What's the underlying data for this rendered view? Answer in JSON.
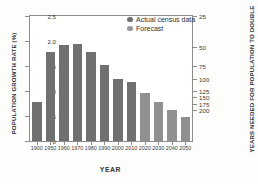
{
  "chart_data": {
    "type": "bar",
    "title": "",
    "xlabel": "YEAR",
    "ylabel": "POPULATION GROWTH RATE (%)",
    "ylabel_right": "YEARS NEEDED FOR POPULATION TO DOUBLE",
    "categories": [
      "1900",
      "1950",
      "1960",
      "1970",
      "1980",
      "1990",
      "2000",
      "2010",
      "2020",
      "2030",
      "2040",
      "2050"
    ],
    "values": [
      0.78,
      1.78,
      1.93,
      1.94,
      1.78,
      1.52,
      1.25,
      1.18,
      0.97,
      0.78,
      0.63,
      0.49
    ],
    "series_of_point": [
      "actual",
      "actual",
      "actual",
      "actual",
      "actual",
      "actual",
      "actual",
      "actual",
      "forecast",
      "forecast",
      "forecast",
      "forecast"
    ],
    "ylim": [
      0,
      2.5
    ],
    "yticks": [
      "0",
      "0.5",
      "1.0",
      "1.5",
      "2.0",
      "2.5"
    ],
    "ytick_values": [
      0,
      0.5,
      1.0,
      1.5,
      2.0,
      2.5
    ],
    "yticks_right": [
      "25",
      "50",
      "75",
      "100",
      "125",
      "150",
      "175",
      "200"
    ],
    "ytick_right_values": [
      2.5,
      1.875,
      1.5,
      1.25,
      1.0,
      0.875,
      0.75,
      0.625
    ],
    "grid": false,
    "legend_position": "top-right",
    "series": [
      {
        "name": "Actual census data",
        "key": "actual",
        "color": "#6f7071"
      },
      {
        "name": "Forecast",
        "key": "forecast",
        "color": "#97999b"
      }
    ]
  },
  "legend": {
    "items": [
      {
        "label": "Actual census data"
      },
      {
        "label": "Forecast"
      }
    ]
  },
  "colors": {
    "actual": "#6f7071",
    "forecast": "#8e9092",
    "axis": "#8d8d8d",
    "text": "#333333",
    "background": "#ffffff"
  }
}
